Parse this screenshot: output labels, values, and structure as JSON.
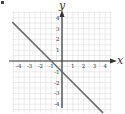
{
  "chart_data": {
    "type": "line",
    "title": "",
    "xlabel": "x",
    "ylabel": "y",
    "xlim": [
      -4.6,
      4.6
    ],
    "ylim": [
      -4.8,
      4.6
    ],
    "grid": true,
    "x_ticks": [
      "-4",
      "-3",
      "-2",
      "-1",
      "1",
      "2",
      "3",
      "4"
    ],
    "y_ticks": [
      "4",
      "3",
      "2",
      "1",
      "-1",
      "-2",
      "-3",
      "-4"
    ],
    "series": [
      {
        "name": "y = -x - 1",
        "x": [
          -4.6,
          -1,
          0,
          3.8
        ],
        "y": [
          3.6,
          0,
          -1,
          -4.8
        ]
      }
    ]
  },
  "labels": {
    "x_axis": "x",
    "y_axis": "y"
  },
  "colors": {
    "grid": "#d8d8d8",
    "axis": "#333333",
    "line": "#6a6a6a",
    "text": "#333333"
  }
}
